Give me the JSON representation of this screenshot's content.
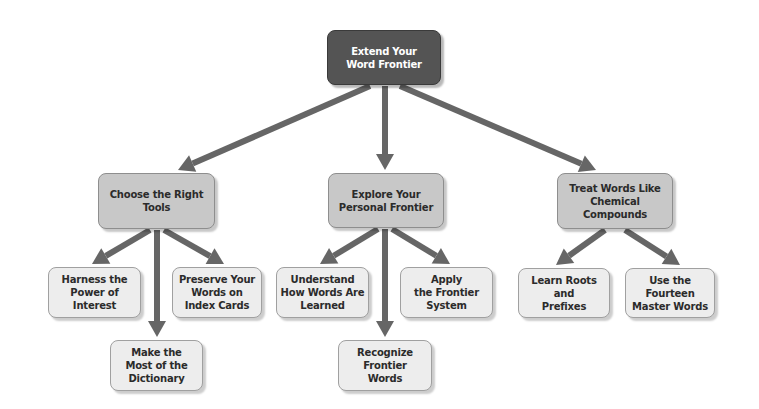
{
  "diagram": {
    "type": "hierarchy",
    "colors": {
      "root_fill": "#545454",
      "level2_fill": "#c8c8c8",
      "level3_fill": "#ededed",
      "arrow": "#666666",
      "text_dark": "#2b2b2b",
      "text_light": "#ffffff"
    },
    "root": {
      "label": "Extend Your\nWord Frontier"
    },
    "branches": [
      {
        "label": "Choose the Right\nTools",
        "children": [
          {
            "label": "Harness the\nPower of\nInterest"
          },
          {
            "label": "Make the\nMost of the\nDictionary"
          },
          {
            "label": "Preserve Your\nWords on\nIndex Cards"
          }
        ]
      },
      {
        "label": "Explore Your\nPersonal Frontier",
        "children": [
          {
            "label": "Understand\nHow Words Are\nLearned"
          },
          {
            "label": "Recognize\nFrontier\nWords"
          },
          {
            "label": "Apply\nthe Frontier\nSystem"
          }
        ]
      },
      {
        "label": "Treat Words Like\nChemical\nCompounds",
        "children": [
          {
            "label": "Learn Roots\nand\nPrefixes"
          },
          {
            "label": "Use the\nFourteen\nMaster Words"
          }
        ]
      }
    ]
  }
}
